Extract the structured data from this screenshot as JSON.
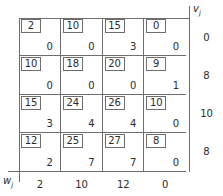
{
  "figure": {
    "type": "transportation-tableau",
    "rows": 4,
    "cols": 4,
    "row_label": "w",
    "row_label_sub": "j",
    "col_label": "v",
    "col_label_sub": "j"
  },
  "labels": {
    "v_label": "v",
    "v_sub": "j",
    "w_label": "w",
    "w_sub": "j"
  },
  "cells": [
    [
      {
        "cost": "2",
        "alloc": "0"
      },
      {
        "cost": "10",
        "alloc": "0"
      },
      {
        "cost": "15",
        "alloc": "3"
      },
      {
        "cost": "0",
        "alloc": "0"
      }
    ],
    [
      {
        "cost": "10",
        "alloc": "0"
      },
      {
        "cost": "18",
        "alloc": "0"
      },
      {
        "cost": "20",
        "alloc": "0"
      },
      {
        "cost": "9",
        "alloc": "1"
      }
    ],
    [
      {
        "cost": "15",
        "alloc": "3"
      },
      {
        "cost": "24",
        "alloc": "4"
      },
      {
        "cost": "26",
        "alloc": "4"
      },
      {
        "cost": "10",
        "alloc": "0"
      }
    ],
    [
      {
        "cost": "12",
        "alloc": "2"
      },
      {
        "cost": "25",
        "alloc": "7"
      },
      {
        "cost": "27",
        "alloc": "7"
      },
      {
        "cost": "8",
        "alloc": "0"
      }
    ]
  ],
  "v_values": [
    "0",
    "8",
    "10",
    "8"
  ],
  "w_values": [
    "2",
    "10",
    "12",
    "0"
  ],
  "chart_data": {
    "type": "table",
    "title": "",
    "xlabel": "w_j",
    "ylabel": "v_j",
    "row_duals": [
      "0",
      "8",
      "10",
      "8"
    ],
    "col_duals": [
      "2",
      "10",
      "12",
      "0"
    ],
    "cost_matrix": [
      [
        2,
        10,
        15,
        0
      ],
      [
        10,
        18,
        20,
        9
      ],
      [
        15,
        24,
        26,
        10
      ],
      [
        12,
        25,
        27,
        8
      ]
    ],
    "allocation_matrix": [
      [
        0,
        0,
        3,
        0
      ],
      [
        0,
        0,
        0,
        1
      ],
      [
        3,
        4,
        4,
        0
      ],
      [
        2,
        7,
        7,
        0
      ]
    ],
    "grid": true,
    "legend": "none"
  }
}
